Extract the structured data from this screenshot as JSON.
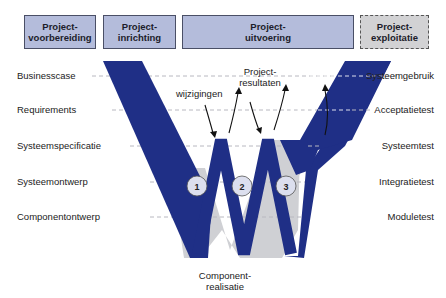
{
  "phases": [
    {
      "line1": "Project-",
      "line2": "voorbereiding",
      "style": "solid"
    },
    {
      "line1": "Project-",
      "line2": "inrichting",
      "style": "solid"
    },
    {
      "line1": "Project-",
      "line2": "uitvoering",
      "style": "solid"
    },
    {
      "line1": "Project-",
      "line2": "exploitatie",
      "style": "dashed"
    }
  ],
  "left_levels": [
    "Businesscase",
    "Requirements",
    "Systeemspecificatie",
    "Systeemontwerp",
    "Componentontwerp"
  ],
  "right_levels": [
    "Systeemgebruik",
    "Acceptatietest",
    "Systeemtest",
    "Integratietest",
    "Moduletest"
  ],
  "annotations": {
    "changes": "wijzigingen",
    "results_line1": "Project-",
    "results_line2": "resultaten",
    "realisation_line1": "Component-",
    "realisation_line2": "realisatie"
  },
  "iterations": [
    "1",
    "2",
    "3"
  ],
  "colors": {
    "band_blue": "#1f2f86",
    "underlay_gray": "#cfd0d4",
    "phase_box_fill": "#b4bcdb",
    "phase_box_future_fill": "#d2d2d4",
    "dashed_line": "#b8b8c0",
    "circle_fill": "#dcdfee"
  }
}
